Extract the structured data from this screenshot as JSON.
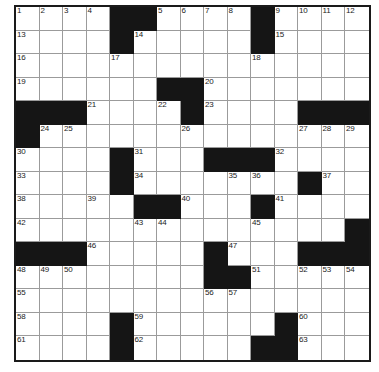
{
  "puzzle": {
    "title": "Crossword Grid",
    "rows": 15,
    "cols": 15,
    "cell_colors": {
      "white": "#ffffff",
      "block": "#151515",
      "gridline": "#9b9b9b",
      "frame": "#1a1a1a",
      "number_text": "#1b1b1b"
    },
    "grid": [
      [
        {
          "type": "white",
          "number": "1"
        },
        {
          "type": "white",
          "number": "2"
        },
        {
          "type": "white",
          "number": "3"
        },
        {
          "type": "white",
          "number": "4"
        },
        {
          "type": "block",
          "number": ""
        },
        {
          "type": "block",
          "number": ""
        },
        {
          "type": "white",
          "number": "5"
        },
        {
          "type": "white",
          "number": "6"
        },
        {
          "type": "white",
          "number": "7"
        },
        {
          "type": "white",
          "number": "8"
        },
        {
          "type": "block",
          "number": ""
        },
        {
          "type": "white",
          "number": "9"
        },
        {
          "type": "white",
          "number": "10"
        },
        {
          "type": "white",
          "number": "11"
        },
        {
          "type": "white",
          "number": "12"
        }
      ],
      [
        {
          "type": "white",
          "number": "13"
        },
        {
          "type": "white",
          "number": ""
        },
        {
          "type": "white",
          "number": ""
        },
        {
          "type": "white",
          "number": ""
        },
        {
          "type": "block",
          "number": ""
        },
        {
          "type": "white",
          "number": "14"
        },
        {
          "type": "white",
          "number": ""
        },
        {
          "type": "white",
          "number": ""
        },
        {
          "type": "white",
          "number": ""
        },
        {
          "type": "white",
          "number": ""
        },
        {
          "type": "block",
          "number": ""
        },
        {
          "type": "white",
          "number": "15"
        },
        {
          "type": "white",
          "number": ""
        },
        {
          "type": "white",
          "number": ""
        },
        {
          "type": "white",
          "number": ""
        }
      ],
      [
        {
          "type": "white",
          "number": "16"
        },
        {
          "type": "white",
          "number": ""
        },
        {
          "type": "white",
          "number": ""
        },
        {
          "type": "white",
          "number": ""
        },
        {
          "type": "white",
          "number": "17"
        },
        {
          "type": "white",
          "number": ""
        },
        {
          "type": "white",
          "number": ""
        },
        {
          "type": "white",
          "number": ""
        },
        {
          "type": "white",
          "number": ""
        },
        {
          "type": "white",
          "number": ""
        },
        {
          "type": "white",
          "number": "18"
        },
        {
          "type": "white",
          "number": ""
        },
        {
          "type": "white",
          "number": ""
        },
        {
          "type": "white",
          "number": ""
        },
        {
          "type": "white",
          "number": ""
        }
      ],
      [
        {
          "type": "white",
          "number": "19"
        },
        {
          "type": "white",
          "number": ""
        },
        {
          "type": "white",
          "number": ""
        },
        {
          "type": "white",
          "number": ""
        },
        {
          "type": "white",
          "number": ""
        },
        {
          "type": "white",
          "number": ""
        },
        {
          "type": "block",
          "number": ""
        },
        {
          "type": "block",
          "number": ""
        },
        {
          "type": "white",
          "number": "20"
        },
        {
          "type": "white",
          "number": ""
        },
        {
          "type": "white",
          "number": ""
        },
        {
          "type": "white",
          "number": ""
        },
        {
          "type": "white",
          "number": ""
        },
        {
          "type": "white",
          "number": ""
        },
        {
          "type": "white",
          "number": ""
        }
      ],
      [
        {
          "type": "block",
          "number": ""
        },
        {
          "type": "block",
          "number": ""
        },
        {
          "type": "block",
          "number": ""
        },
        {
          "type": "white",
          "number": "21"
        },
        {
          "type": "white",
          "number": ""
        },
        {
          "type": "white",
          "number": ""
        },
        {
          "type": "white",
          "number": "22"
        },
        {
          "type": "block",
          "number": ""
        },
        {
          "type": "white",
          "number": "23"
        },
        {
          "type": "white",
          "number": ""
        },
        {
          "type": "white",
          "number": ""
        },
        {
          "type": "white",
          "number": ""
        },
        {
          "type": "block",
          "number": ""
        },
        {
          "type": "block",
          "number": ""
        },
        {
          "type": "block",
          "number": ""
        }
      ],
      [
        {
          "type": "block",
          "number": ""
        },
        {
          "type": "white",
          "number": "24"
        },
        {
          "type": "white",
          "number": "25"
        },
        {
          "type": "white",
          "number": ""
        },
        {
          "type": "white",
          "number": ""
        },
        {
          "type": "white",
          "number": ""
        },
        {
          "type": "white",
          "number": ""
        },
        {
          "type": "white",
          "number": "26"
        },
        {
          "type": "white",
          "number": ""
        },
        {
          "type": "white",
          "number": ""
        },
        {
          "type": "white",
          "number": ""
        },
        {
          "type": "white",
          "number": ""
        },
        {
          "type": "white",
          "number": "27"
        },
        {
          "type": "white",
          "number": "28"
        },
        {
          "type": "white",
          "number": "29"
        }
      ],
      [
        {
          "type": "white",
          "number": "30"
        },
        {
          "type": "white",
          "number": ""
        },
        {
          "type": "white",
          "number": ""
        },
        {
          "type": "white",
          "number": ""
        },
        {
          "type": "block",
          "number": ""
        },
        {
          "type": "white",
          "number": "31"
        },
        {
          "type": "white",
          "number": ""
        },
        {
          "type": "white",
          "number": ""
        },
        {
          "type": "block",
          "number": ""
        },
        {
          "type": "block",
          "number": ""
        },
        {
          "type": "block",
          "number": ""
        },
        {
          "type": "white",
          "number": "32"
        },
        {
          "type": "white",
          "number": ""
        },
        {
          "type": "white",
          "number": ""
        },
        {
          "type": "white",
          "number": ""
        }
      ],
      [
        {
          "type": "white",
          "number": "33"
        },
        {
          "type": "white",
          "number": ""
        },
        {
          "type": "white",
          "number": ""
        },
        {
          "type": "white",
          "number": ""
        },
        {
          "type": "block",
          "number": ""
        },
        {
          "type": "white",
          "number": "34"
        },
        {
          "type": "white",
          "number": ""
        },
        {
          "type": "white",
          "number": ""
        },
        {
          "type": "white",
          "number": ""
        },
        {
          "type": "white",
          "number": "35"
        },
        {
          "type": "white",
          "number": "36"
        },
        {
          "type": "white",
          "number": ""
        },
        {
          "type": "block",
          "number": ""
        },
        {
          "type": "white",
          "number": "37"
        },
        {
          "type": "white",
          "number": ""
        }
      ],
      [
        {
          "type": "white",
          "number": "38"
        },
        {
          "type": "white",
          "number": ""
        },
        {
          "type": "white",
          "number": ""
        },
        {
          "type": "white",
          "number": "39"
        },
        {
          "type": "white",
          "number": ""
        },
        {
          "type": "block",
          "number": ""
        },
        {
          "type": "block",
          "number": ""
        },
        {
          "type": "white",
          "number": "40"
        },
        {
          "type": "white",
          "number": ""
        },
        {
          "type": "white",
          "number": ""
        },
        {
          "type": "block",
          "number": ""
        },
        {
          "type": "white",
          "number": "41"
        },
        {
          "type": "white",
          "number": ""
        },
        {
          "type": "white",
          "number": ""
        },
        {
          "type": "white",
          "number": ""
        }
      ],
      [
        {
          "type": "white",
          "number": "42"
        },
        {
          "type": "white",
          "number": ""
        },
        {
          "type": "white",
          "number": ""
        },
        {
          "type": "white",
          "number": ""
        },
        {
          "type": "white",
          "number": ""
        },
        {
          "type": "white",
          "number": "43"
        },
        {
          "type": "white",
          "number": "44"
        },
        {
          "type": "white",
          "number": ""
        },
        {
          "type": "white",
          "number": ""
        },
        {
          "type": "white",
          "number": ""
        },
        {
          "type": "white",
          "number": "45"
        },
        {
          "type": "white",
          "number": ""
        },
        {
          "type": "white",
          "number": ""
        },
        {
          "type": "white",
          "number": ""
        },
        {
          "type": "block",
          "number": ""
        }
      ],
      [
        {
          "type": "block",
          "number": ""
        },
        {
          "type": "block",
          "number": ""
        },
        {
          "type": "block",
          "number": ""
        },
        {
          "type": "white",
          "number": "46"
        },
        {
          "type": "white",
          "number": ""
        },
        {
          "type": "white",
          "number": ""
        },
        {
          "type": "white",
          "number": ""
        },
        {
          "type": "white",
          "number": ""
        },
        {
          "type": "block",
          "number": ""
        },
        {
          "type": "white",
          "number": "47"
        },
        {
          "type": "white",
          "number": ""
        },
        {
          "type": "white",
          "number": ""
        },
        {
          "type": "block",
          "number": ""
        },
        {
          "type": "block",
          "number": ""
        },
        {
          "type": "block",
          "number": ""
        }
      ],
      [
        {
          "type": "white",
          "number": "48"
        },
        {
          "type": "white",
          "number": "49"
        },
        {
          "type": "white",
          "number": "50"
        },
        {
          "type": "white",
          "number": ""
        },
        {
          "type": "white",
          "number": ""
        },
        {
          "type": "white",
          "number": ""
        },
        {
          "type": "white",
          "number": ""
        },
        {
          "type": "white",
          "number": ""
        },
        {
          "type": "block",
          "number": ""
        },
        {
          "type": "block",
          "number": ""
        },
        {
          "type": "white",
          "number": "51"
        },
        {
          "type": "white",
          "number": ""
        },
        {
          "type": "white",
          "number": "52"
        },
        {
          "type": "white",
          "number": "53"
        },
        {
          "type": "white",
          "number": "54"
        }
      ],
      [
        {
          "type": "white",
          "number": "55"
        },
        {
          "type": "white",
          "number": ""
        },
        {
          "type": "white",
          "number": ""
        },
        {
          "type": "white",
          "number": ""
        },
        {
          "type": "white",
          "number": ""
        },
        {
          "type": "white",
          "number": ""
        },
        {
          "type": "white",
          "number": ""
        },
        {
          "type": "white",
          "number": ""
        },
        {
          "type": "white",
          "number": "56"
        },
        {
          "type": "white",
          "number": "57"
        },
        {
          "type": "white",
          "number": ""
        },
        {
          "type": "white",
          "number": ""
        },
        {
          "type": "white",
          "number": ""
        },
        {
          "type": "white",
          "number": ""
        },
        {
          "type": "white",
          "number": ""
        }
      ],
      [
        {
          "type": "white",
          "number": "58"
        },
        {
          "type": "white",
          "number": ""
        },
        {
          "type": "white",
          "number": ""
        },
        {
          "type": "white",
          "number": ""
        },
        {
          "type": "block",
          "number": ""
        },
        {
          "type": "white",
          "number": "59"
        },
        {
          "type": "white",
          "number": ""
        },
        {
          "type": "white",
          "number": ""
        },
        {
          "type": "white",
          "number": ""
        },
        {
          "type": "white",
          "number": ""
        },
        {
          "type": "white",
          "number": ""
        },
        {
          "type": "block",
          "number": ""
        },
        {
          "type": "white",
          "number": "60"
        },
        {
          "type": "white",
          "number": ""
        },
        {
          "type": "white",
          "number": ""
        }
      ],
      [
        {
          "type": "white",
          "number": "61"
        },
        {
          "type": "white",
          "number": ""
        },
        {
          "type": "white",
          "number": ""
        },
        {
          "type": "white",
          "number": ""
        },
        {
          "type": "block",
          "number": ""
        },
        {
          "type": "white",
          "number": "62"
        },
        {
          "type": "white",
          "number": ""
        },
        {
          "type": "white",
          "number": ""
        },
        {
          "type": "white",
          "number": ""
        },
        {
          "type": "white",
          "number": ""
        },
        {
          "type": "block",
          "number": ""
        },
        {
          "type": "block",
          "number": ""
        },
        {
          "type": "white",
          "number": "63"
        },
        {
          "type": "white",
          "number": ""
        },
        {
          "type": "white",
          "number": ""
        }
      ]
    ]
  }
}
